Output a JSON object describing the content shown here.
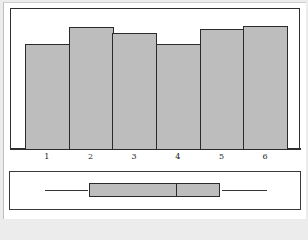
{
  "chart_data": [
    {
      "type": "bar",
      "title": "",
      "xlabel": "",
      "ylabel": "",
      "categories": [
        "1",
        "2",
        "3",
        "4",
        "5",
        "6"
      ],
      "values": [
        106,
        123,
        117,
        106,
        121,
        124
      ],
      "value_note": "relative bar heights (no y-axis shown), approx. pixel-proportional frequencies",
      "bar_color": "#bdbdbd",
      "edge_color": "#2a2a2a",
      "grid": false,
      "legend": null
    },
    {
      "type": "boxplot",
      "orientation": "horizontal",
      "xlim": [
        0.5,
        6.5
      ],
      "min": 1.0,
      "q1": 2.0,
      "median": 4.0,
      "q3": 5.0,
      "max": 6.0,
      "box_color": "#bdbdbd"
    }
  ],
  "axis": {
    "x_ticks": [
      "1",
      "2",
      "3",
      "4",
      "5",
      "6"
    ]
  },
  "colors": {
    "bar_fill": "#bdbdbd",
    "edge": "#2a2a2a",
    "background": "#ffffff"
  }
}
